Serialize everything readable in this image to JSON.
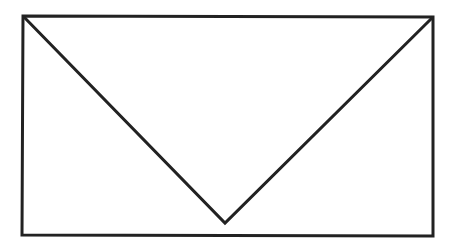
{
  "canvas": {
    "width": 455,
    "height": 249,
    "background": "#ffffff"
  },
  "stroke": {
    "color": "#222222",
    "width": 3
  },
  "shapes": {
    "rectangle": {
      "points": "23,16 433,17 433,236 22,235"
    },
    "v_lines": {
      "points": "23,16 225,223 433,17"
    }
  }
}
